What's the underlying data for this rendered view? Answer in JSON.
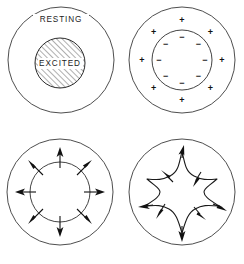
{
  "figure": {
    "title": "",
    "background_color": "#ffffff",
    "stroke_color": "#2e2e2e",
    "width": 244,
    "height": 264,
    "panel_layout": "2x2"
  },
  "panels": [
    {
      "id": "resting-excited",
      "position": "top-left",
      "outer_circle": {
        "cx": 61,
        "cy": 60,
        "r": 53
      },
      "inner_circle": {
        "cx": 60,
        "cy": 63,
        "r": 25,
        "fill": "diagonal-hatch"
      },
      "labels": {
        "outer": "RESTING",
        "inner": "EXCITED"
      }
    },
    {
      "id": "polarity",
      "position": "top-right",
      "outer_circle": {
        "cx": 60,
        "cy": 60,
        "r": 53
      },
      "inner_circle": {
        "cx": 60,
        "cy": 60,
        "r": 30
      },
      "outer_charge_symbol": "+",
      "inner_charge_symbol": "−",
      "charge_pair_count": 8,
      "outer_symbol_radius": 40,
      "inner_symbol_radius": 23
    },
    {
      "id": "radial-propagation",
      "position": "bottom-left",
      "outer_circle": {
        "cx": 60,
        "cy": 60,
        "r": 53
      },
      "inner_circle": {
        "cx": 60,
        "cy": 60,
        "r": 30
      },
      "arrow_count": 8,
      "arrow_inner_radius": 24,
      "arrow_outer_radius": 43,
      "arrow_direction": "outward"
    },
    {
      "id": "star-wavefront",
      "position": "bottom-right",
      "outer_circle": {
        "cx": 60,
        "cy": 60,
        "r": 53
      },
      "wavefront_shape": "four-pointed-star",
      "tip_arrow_count": 4,
      "notch_arrow_count": 4,
      "tip_radius": 42,
      "notch_radius": 17,
      "tip_arrow_direction": "outward",
      "notch_arrow_direction": "outward-diagonal"
    }
  ]
}
